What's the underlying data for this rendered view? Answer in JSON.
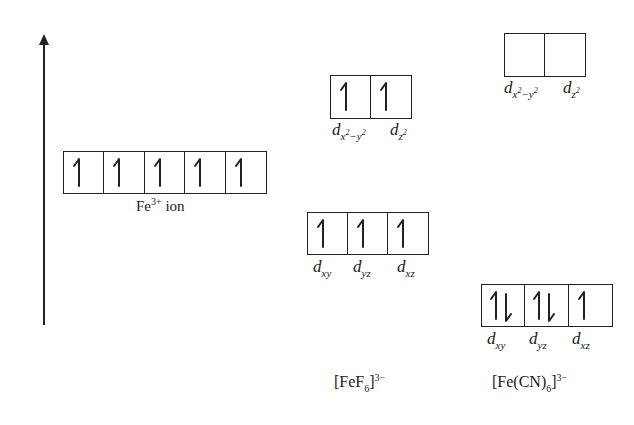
{
  "diagram": {
    "type": "crystal-field-splitting",
    "axis": {
      "label": "",
      "direction": "up",
      "meaning": "energy"
    },
    "free_ion": {
      "caption_main": "Fe",
      "caption_sup": "3+",
      "caption_tail": " ion",
      "orbitals": [
        {
          "electrons": "up"
        },
        {
          "electrons": "up"
        },
        {
          "electrons": "up"
        },
        {
          "electrons": "up"
        },
        {
          "electrons": "up"
        }
      ]
    },
    "complexes": [
      {
        "name_prefix": "[FeF",
        "name_sub": "6",
        "name_suffix": "]",
        "name_charge": "3−",
        "field": "weak",
        "eg": [
          {
            "label_base": "d",
            "label_sub": "x",
            "label_sup1": "2",
            "label_mid": "−y",
            "label_sup2": "2",
            "electrons": "up"
          },
          {
            "label_base": "d",
            "label_sub": "z",
            "label_sup1": "2",
            "label_mid": "",
            "label_sup2": "",
            "electrons": "up"
          }
        ],
        "t2g": [
          {
            "label_base": "d",
            "label_sub": "xy",
            "electrons": "up"
          },
          {
            "label_base": "d",
            "label_sub": "yz",
            "electrons": "up"
          },
          {
            "label_base": "d",
            "label_sub": "xz",
            "electrons": "up"
          }
        ]
      },
      {
        "name_prefix": "[Fe(CN)",
        "name_sub": "6",
        "name_suffix": "]",
        "name_charge": "3−",
        "field": "strong",
        "eg": [
          {
            "label_base": "d",
            "label_sub": "x",
            "label_sup1": "2",
            "label_mid": "−y",
            "label_sup2": "2",
            "electrons": "empty"
          },
          {
            "label_base": "d",
            "label_sub": "z",
            "label_sup1": "2",
            "label_mid": "",
            "label_sup2": "",
            "electrons": "empty"
          }
        ],
        "t2g": [
          {
            "label_base": "d",
            "label_sub": "xy",
            "electrons": "pair"
          },
          {
            "label_base": "d",
            "label_sub": "yz",
            "electrons": "pair"
          },
          {
            "label_base": "d",
            "label_sub": "xz",
            "electrons": "up"
          }
        ]
      }
    ],
    "colors": {
      "ink": "#222222",
      "background": "#ffffff"
    }
  }
}
